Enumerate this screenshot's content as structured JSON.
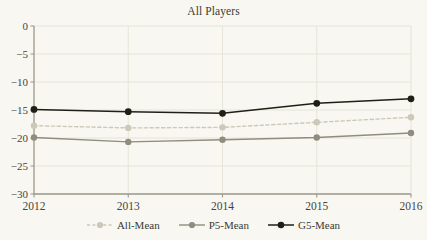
{
  "chart_data": {
    "type": "line",
    "title": "All Players",
    "xlabel": "",
    "ylabel": "",
    "x": [
      2012,
      2013,
      2014,
      2015,
      2016
    ],
    "xtick_labels": [
      "2012",
      "2013",
      "2014",
      "2015",
      "2016"
    ],
    "ytick_labels": [
      "0",
      "−5",
      "−10",
      "−15",
      "−20",
      "−25",
      "−30"
    ],
    "ytick_values": [
      0,
      -5,
      -10,
      -15,
      -20,
      -25,
      -30
    ],
    "ylim": [
      -30,
      0
    ],
    "xlim": [
      2012,
      2016
    ],
    "grid": "both",
    "legend_position": "bottom-center",
    "series": [
      {
        "name": "All-Mean",
        "values": [
          -17.8,
          -18.2,
          -18.1,
          -17.2,
          -16.3
        ],
        "color": "#ccc9b8",
        "line_style": "dashed",
        "marker": "circle"
      },
      {
        "name": "P5-Mean",
        "values": [
          -19.9,
          -20.7,
          -20.3,
          -19.9,
          -19.1
        ],
        "color": "#8f8d7e",
        "line_style": "solid",
        "marker": "circle"
      },
      {
        "name": "G5-Mean",
        "values": [
          -14.9,
          -15.3,
          -15.6,
          -13.8,
          -13.0
        ],
        "color": "#1f1f18",
        "line_style": "solid",
        "marker": "circle"
      }
    ]
  },
  "colors": {
    "background": "#f8f7f1",
    "axis": "#9b9a8c",
    "grid": "#e4e2d6",
    "text": "#3b3b33"
  },
  "legend": {
    "entries": [
      "All-Mean",
      "P5-Mean",
      "G5-Mean"
    ]
  }
}
